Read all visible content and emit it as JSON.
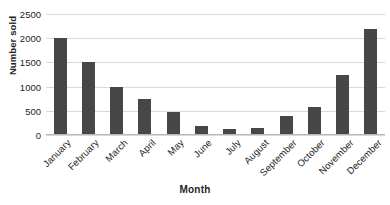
{
  "chart_data": {
    "type": "bar",
    "title": "",
    "xlabel": "Month",
    "ylabel": "Number sold",
    "categories": [
      "January",
      "February",
      "March",
      "April",
      "May",
      "June",
      "July",
      "August",
      "September",
      "October",
      "November",
      "December"
    ],
    "values": [
      2000,
      1500,
      1000,
      750,
      480,
      180,
      130,
      150,
      390,
      580,
      1250,
      2200
    ],
    "ylim": [
      0,
      2500
    ],
    "yticks": [
      0,
      500,
      1000,
      1500,
      2000,
      2500
    ],
    "ytick_labels": [
      "0",
      "500",
      "1000",
      "1500",
      "2000",
      "2500"
    ],
    "grid": true,
    "legend": false,
    "series_color": "#474747",
    "gridline_color": "#d9d9d9"
  }
}
